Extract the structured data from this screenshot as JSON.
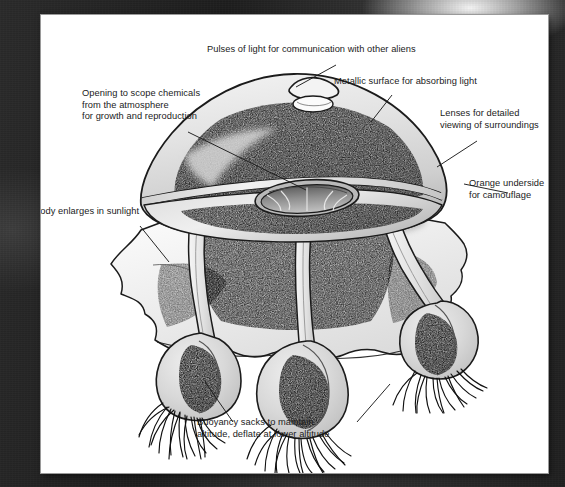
{
  "figure": {
    "medium": "pen-and-ink line drawing with grey wash, photographed on a dark surface",
    "page_color": "#ffffff",
    "ink_color": "#1b1b1b",
    "backdrop_color": "#242424"
  },
  "labels": [
    {
      "id": "pulses-of-light",
      "text": "Pulses of light for communication with other aliens",
      "x": 166,
      "y": 36,
      "align": "left",
      "leader": {
        "from": [
          295,
          50
        ],
        "to": [
          252,
          72
        ]
      }
    },
    {
      "id": "opening-to-scope-chemicals",
      "text": "Opening to scope chemicals\nfrom the atmosphere\nfor growth and reproduction",
      "x": 41,
      "y": 80,
      "align": "left",
      "leader": {
        "from": [
          148,
          118
        ],
        "to": [
          264,
          174
        ]
      }
    },
    {
      "id": "metallic-surface",
      "text": "Metallic surface for absorbing light",
      "x": 334,
      "y": 68,
      "align": "left",
      "leader": {
        "from": [
          351,
          80
        ],
        "to": [
          332,
          105
        ]
      }
    },
    {
      "id": "lenses-for-viewing",
      "text": "Lenses for detailed\nviewing of surroundings",
      "x": 441,
      "y": 100,
      "align": "left",
      "leader": {
        "from": [
          437,
          126
        ],
        "to": [
          398,
          151
        ]
      }
    },
    {
      "id": "orange-underside",
      "text": "Orange underside\nfor camouflage",
      "x": 470,
      "y": 170,
      "align": "left",
      "leader": {
        "from": [
          466,
          178
        ],
        "to": [
          424,
          170
        ]
      }
    },
    {
      "id": "body-enlarges-in-sunlight",
      "text": "Body enlarges in sunlight",
      "x": 32,
      "y": 198,
      "align": "left",
      "leader": {
        "from": [
          98,
          212
        ],
        "to": [
          126,
          245
        ]
      }
    },
    {
      "id": "buoyancy-sacks",
      "text": "Buoyancy sacks to maintain\naltitude, deflate at lower altitude",
      "x": 197,
      "y": 409,
      "align": "left",
      "leaders": [
        {
          "from": [
            193,
            409
          ],
          "to": [
            165,
            368
          ]
        },
        {
          "from": [
            318,
            409
          ],
          "to": [
            348,
            370
          ]
        }
      ]
    }
  ],
  "anatomy": {
    "parts": [
      "dome-canopy",
      "light-pulse-bump",
      "light-pulse-oval",
      "chemical-scoop-opening",
      "lens-rim-band",
      "underside-skirt",
      "tentacle-stalks",
      "buoyancy-sacks",
      "root-filaments"
    ],
    "tentacle_count": 3,
    "buoyancy_sack_count": 3
  },
  "colors": {
    "ink": "#1b1b1b",
    "wash_light": "#e4e4e4",
    "wash_mid": "#c9c9c9",
    "wash_dark": "#8d8d8d",
    "paper": "#ffffff",
    "backdrop": "#242424"
  }
}
